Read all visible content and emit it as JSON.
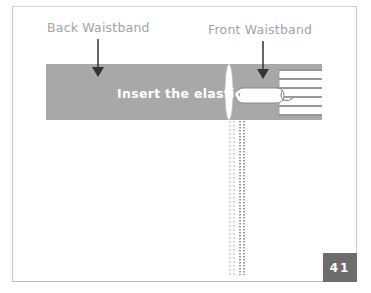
{
  "figure": {
    "labels": {
      "back_waistband": "Back Waistband",
      "front_waistband": "Front Waistband",
      "instruction": "Insert the elastic"
    },
    "page_number": "41",
    "colors": {
      "band": "#a8a8a8",
      "arrow": "#333333",
      "label": "#a3a3a3",
      "page_box": "#6d6d6d",
      "frame": "#c8c8c8"
    }
  }
}
